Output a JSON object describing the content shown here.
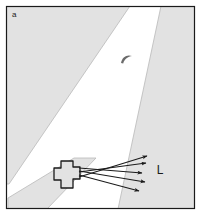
{
  "figure": {
    "panel_letter": "a",
    "type": "schematic-map-diagram",
    "frame": {
      "border_color": "#1a1a1a",
      "border_width": 1,
      "width": 201,
      "height": 215,
      "background": "#ffffff"
    },
    "colors": {
      "shaded_terrain": "#e2e2e2",
      "shaded_terrain_outline": "#b4b4b4",
      "open_corridor": "#ffffff",
      "structure_fill": "#e2e2e2",
      "structure_outline": "#1a1a1a",
      "arrow_color": "#1a1a1a",
      "text_color": "#1a1a1a"
    },
    "labels": [
      {
        "name": "panel-letter",
        "text": "a",
        "x": 12,
        "y": 16,
        "size": 8
      },
      {
        "name": "region-label-L",
        "text": "L",
        "x": 160,
        "y": 174,
        "size": 12
      }
    ],
    "regions": [
      {
        "name": "upper-left-shaded-region",
        "description": "Large shaded area filling the upper-left, bounded below-right by a diagonal edge",
        "points": "6,6 129,6 8,180 6,180"
      },
      {
        "name": "right-shaded-region",
        "description": "Shaded area along the right side, bounded left by a steep diagonal edge",
        "points": "161,6 195,6 195,209 120,209"
      },
      {
        "name": "lower-left-shaded-band",
        "description": "Narrow shaded band crossing the lower-left corner",
        "points": "80,160 98,160 46,209 6,209 6,200"
      }
    ],
    "corridor": {
      "name": "white-corridor",
      "description": "Open white diagonal band running from upper-right to lower-left between the shaded regions"
    },
    "structure": {
      "name": "cross-shaped-structure",
      "description": "Plus / cross shaped object at the left end of the arrow fan",
      "center_x": 67,
      "center_y": 175,
      "arm_half_width": 6,
      "half_size": 14
    },
    "arc_mark": {
      "name": "curved-arc-mark",
      "description": "Small crescent / comma shaped mark in the open corridor",
      "x": 126,
      "y": 60
    },
    "arrows": {
      "count": 5,
      "origin_x": 79,
      "origin_y": 172,
      "items": [
        {
          "name": "arrow-1",
          "x1": 79,
          "y1": 176,
          "x2": 148,
          "y2": 155
        },
        {
          "name": "arrow-2",
          "x1": 79,
          "y1": 172,
          "x2": 147,
          "y2": 162
        },
        {
          "name": "arrow-3",
          "x1": 79,
          "y1": 168,
          "x2": 143,
          "y2": 172
        },
        {
          "name": "arrow-4",
          "x1": 79,
          "y1": 171,
          "x2": 146,
          "y2": 181
        },
        {
          "name": "arrow-5",
          "x1": 79,
          "y1": 174,
          "x2": 140,
          "y2": 190
        }
      ]
    }
  }
}
